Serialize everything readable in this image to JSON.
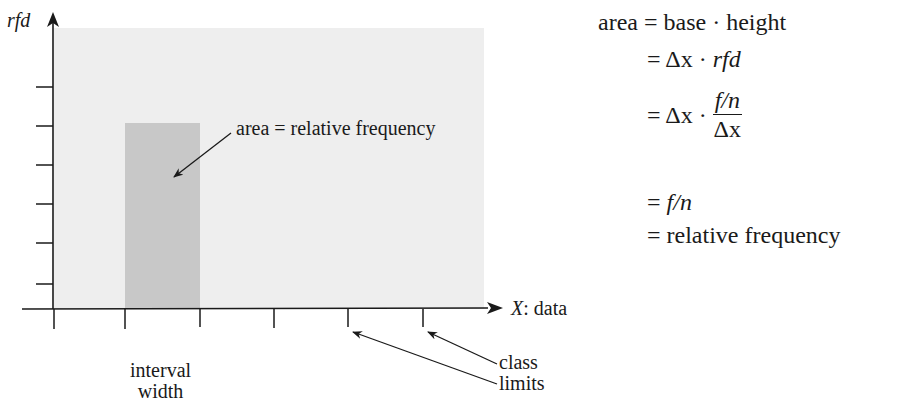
{
  "diagram": {
    "y_axis_label": "rfd",
    "x_axis_label_var": "X",
    "x_axis_label_rest": ": data",
    "bar_annotation": "area = relative frequency",
    "interval_label_line1": "interval",
    "interval_label_line2": "width",
    "class_label_line1": "class",
    "class_label_line2": "limits",
    "colors": {
      "panel": "#eeeeee",
      "bar": "#c8c8c8",
      "ink": "#1a1a1a"
    },
    "y_tick_count": 6,
    "x_tick_count": 6
  },
  "formula": {
    "line1_lhs": "area",
    "line1_rhs": "= base · height",
    "line2": "= Δx · ",
    "line2_italic": "rfd",
    "line3_prefix": "= Δx · ",
    "line3_num": "f/n",
    "line3_den": "Δx",
    "line4_eq": "= ",
    "line4_italic": "f/n",
    "line5": "= relative frequency"
  }
}
